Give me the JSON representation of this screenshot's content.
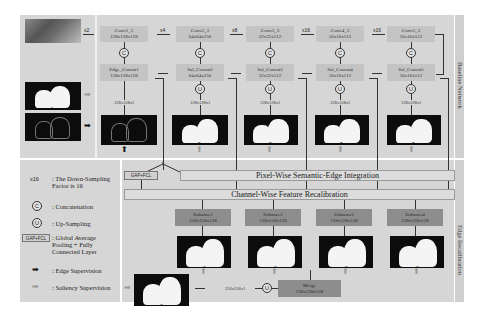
{
  "sections": {
    "top_label": "Baseline Network",
    "bottom_label": "Edge Recalibration"
  },
  "inputs": {
    "rgb_image": "input-photo",
    "saliency_gt": "saliency-mask",
    "edge_gt": "edge-map",
    "x2": "x2"
  },
  "conv_blocks": [
    {
      "name": "Conv1_2",
      "dims": "128x128x128"
    },
    {
      "name": "Conv2_3",
      "dims": "64x64x256"
    },
    {
      "name": "Conv3_3",
      "dims": "32x32x512"
    },
    {
      "name": "Conv4_3",
      "dims": "16x16x512"
    },
    {
      "name": "Conv5_3",
      "dims": "16x16x512"
    }
  ],
  "factors": [
    "x4",
    "x8",
    "x16",
    "x16"
  ],
  "concat_blocks": [
    {
      "name": "Edge_Concat1",
      "dims": "128x128x128"
    },
    {
      "name": "Sal_Concat2",
      "dims": "64x64x256"
    },
    {
      "name": "Sal_Concat3",
      "dims": "32x32x512"
    },
    {
      "name": "Sal_Concat4",
      "dims": "16x16x512"
    },
    {
      "name": "Sal_Concat5",
      "dims": "16x16x512"
    }
  ],
  "concat_symbol": "C",
  "upsample_symbol": "U",
  "output_dims": "128x128x1",
  "bars": {
    "gap_fcl": "GAP+FCL",
    "pixel_wise": "Pixel-Wise Semantic-Edge Integration",
    "channel_wise": "Channel-Wise Feature Recalibration"
  },
  "enhance_blocks": [
    {
      "name": "Enhance1",
      "dims": "128x128x128"
    },
    {
      "name": "Enhance2",
      "dims": "128x128x128"
    },
    {
      "name": "Enhance3",
      "dims": "128x128x128"
    },
    {
      "name": "Enhance4",
      "dims": "128x128x128"
    }
  ],
  "merge": {
    "name": "Merge",
    "dims": "128x128x128"
  },
  "final_dims": "256x256x1",
  "legend": {
    "factor_symbol": "x16",
    "factor_text": ": The Down-Sampling Factor is 16",
    "concat_text": ": Concatenation",
    "upsample_text": ": Up-Sampling",
    "gap_symbol": "GAP+FCL",
    "gap_text": ": Global Average Pooling + Fully Connected Layer",
    "edge_text": ": Edge Supervision",
    "saliency_text": ": Saliency Supervision"
  },
  "colors": {
    "panel": "#d6d6d6",
    "block": "#c4c4c4",
    "dark_block": "#8d8d8d",
    "edge_arrow": "#111111",
    "saliency_arrow": "#9a9a9a"
  }
}
